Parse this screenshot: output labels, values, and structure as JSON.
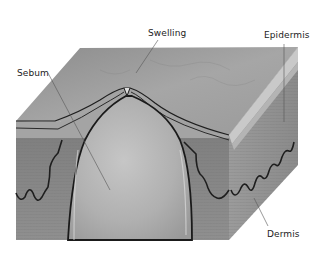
{
  "figure": {
    "labels": [
      {
        "id": "swelling",
        "text": "Swelling",
        "x": 148,
        "y": 28
      },
      {
        "id": "epidermis",
        "text": "Epidermis",
        "x": 264,
        "y": 30
      },
      {
        "id": "sebum",
        "text": "Sebum",
        "x": 17,
        "y": 68
      },
      {
        "id": "dermis",
        "text": "Dermis",
        "x": 267,
        "y": 229
      }
    ],
    "colors": {
      "background": "#ffffff",
      "top_surface": "#9a9a9a",
      "front_face": "#888888",
      "right_face": "#a2a2a2",
      "sebum": "#b4b4b4",
      "outline": "#1e1e1e",
      "leader_line": "#555555"
    }
  }
}
